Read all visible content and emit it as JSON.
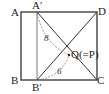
{
  "diagram": {
    "type": "geometry-figure",
    "labels": {
      "A": "A",
      "A_prime": "A′",
      "D": "D",
      "B": "B",
      "B_prime": "B′",
      "C": "C",
      "Q": "Q(=P)"
    },
    "lengths": {
      "A_prime_Q": "8",
      "B_prime_Q": "6"
    },
    "colors": {
      "stroke": "#333333",
      "dashed": "#777777",
      "fill": "#ffffff"
    }
  }
}
